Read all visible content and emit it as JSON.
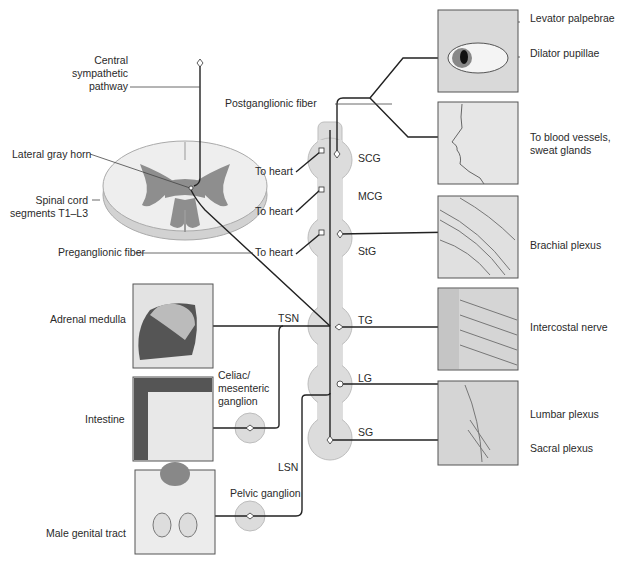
{
  "diagram": {
    "colors": {
      "chain_fill": "#dcdcdc",
      "chain_stroke": "#b8b8b8",
      "fiber": "#222222",
      "panel_fill": "#e4e4e4",
      "panel_stroke": "#555555",
      "gray_matter": "#8c8c8c",
      "cord_fill": "#ececec"
    },
    "labels": {
      "central_pathway_1": "Central",
      "central_pathway_2": "sympathetic",
      "central_pathway_3": "pathway",
      "lateral_gray_horn": "Lateral gray horn",
      "spinal_cord_1": "Spinal cord",
      "spinal_cord_2": "segments T1–L3",
      "preganglionic_fiber": "Preganglionic fiber",
      "postganglionic_fiber": "Postganglionic fiber",
      "to_heart_1": "To heart",
      "to_heart_2": "To heart",
      "to_heart_3": "To heart",
      "adrenal_medulla": "Adrenal medulla",
      "intestine": "Intestine",
      "male_genital_tract": "Male genital tract",
      "celiac_1": "Celiac/",
      "celiac_2": "mesenteric",
      "celiac_3": "ganglion",
      "pelvic_ganglion": "Pelvic ganglion",
      "tsn": "TSN",
      "lsn": "LSN",
      "levator_palpebrae": "Levator palpebrae",
      "dilator_pupillae": "Dilator pupillae",
      "blood_vessels_1": "To blood vessels,",
      "blood_vessels_2": "sweat glands",
      "brachial_plexus": "Brachial plexus",
      "intercostal_nerve": "Intercostal nerve",
      "lumbar_plexus": "Lumbar plexus",
      "sacral_plexus": "Sacral plexus"
    },
    "ganglia": [
      {
        "id": "SCG",
        "label": "SCG"
      },
      {
        "id": "MCG",
        "label": "MCG"
      },
      {
        "id": "StG",
        "label": "StG"
      },
      {
        "id": "TG",
        "label": "TG"
      },
      {
        "id": "LG",
        "label": "LG"
      },
      {
        "id": "SG",
        "label": "SG"
      }
    ],
    "panels": [
      {
        "id": "eye",
        "depicts": "eye"
      },
      {
        "id": "face",
        "depicts": "face-profile"
      },
      {
        "id": "brachial",
        "depicts": "brachial-plexus"
      },
      {
        "id": "intercostal",
        "depicts": "ribs-intercostal"
      },
      {
        "id": "lumbosacral",
        "depicts": "pelvis-lumbosacral"
      },
      {
        "id": "adrenal",
        "depicts": "adrenal-gland"
      },
      {
        "id": "intestine",
        "depicts": "intestine"
      },
      {
        "id": "genital",
        "depicts": "male-genital-tract"
      }
    ]
  }
}
